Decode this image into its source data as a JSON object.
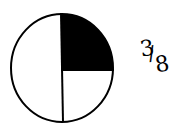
{
  "diagram": {
    "type": "fraction-circle",
    "segments": 4,
    "shaded_segments": [
      "top-right"
    ],
    "fill_color": "#000000",
    "stroke_color": "#000000",
    "label": {
      "numerator": "3",
      "slash": "/",
      "denominator": "8"
    }
  }
}
